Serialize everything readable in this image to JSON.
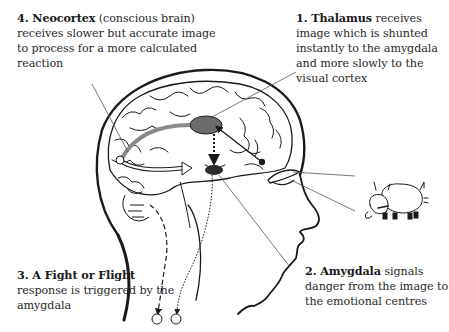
{
  "labels": {
    "neocortex": {
      "number": "4.",
      "term": "Neocortex",
      "text": "(conscious brain) receives slower but accurate image to process for a more calculated reaction"
    },
    "thalamus": {
      "number": "1.",
      "term": "Thalamus",
      "text": "receives image which is shunted instantly to the amygdala and more slowly to the visual cortex"
    },
    "fight_flight": {
      "number": "3.",
      "term": "A Fight or Flight",
      "text": "response is triggered by the amygdala"
    },
    "amygdala": {
      "number": "2.",
      "term": "Amygdala",
      "text": "signals danger from the image to the emotional centres"
    }
  },
  "illustration": {
    "subject": "human head profile with brain",
    "stimulus": "charging bull",
    "colors": {
      "line": "#1a1a1a",
      "thalamus_fill": "#6b6b6b",
      "amygdala_fill": "#2b2b2b",
      "pathway_gray": "#8a8a8a",
      "leader_line": "#555555"
    }
  }
}
